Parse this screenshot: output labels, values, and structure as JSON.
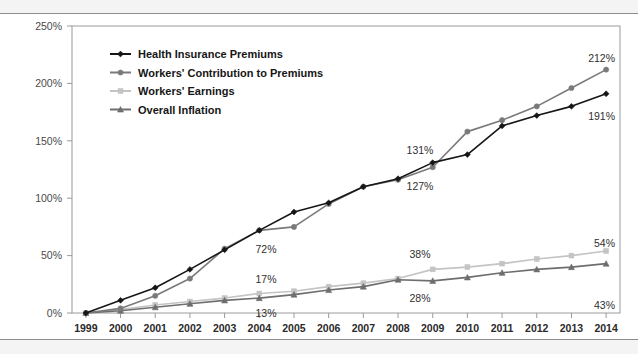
{
  "chart_data": {
    "type": "line",
    "title": "",
    "xlabel": "",
    "ylabel": "",
    "x": [
      1999,
      2000,
      2001,
      2002,
      2003,
      2004,
      2005,
      2006,
      2007,
      2008,
      2009,
      2010,
      2011,
      2012,
      2013,
      2014
    ],
    "categories": [
      "1999",
      "2000",
      "2001",
      "2002",
      "2003",
      "2004",
      "2005",
      "2006",
      "2007",
      "2008",
      "2009",
      "2010",
      "2011",
      "2012",
      "2013",
      "2014"
    ],
    "ylim": [
      0,
      250
    ],
    "ytick_values": [
      0,
      50,
      100,
      150,
      200,
      250
    ],
    "ytick_labels": [
      "0%",
      "50%",
      "100%",
      "150%",
      "200%",
      "250%"
    ],
    "grid": false,
    "legend_position": "top-left-inside",
    "series": [
      {
        "name": "Health Insurance Premiums",
        "color": "#161616",
        "marker": "diamond",
        "values": [
          0,
          11,
          22,
          38,
          55,
          72,
          88,
          96,
          110,
          117,
          131,
          138,
          163,
          172,
          180,
          191
        ]
      },
      {
        "name": "Workers' Contribution to Premiums",
        "color": "#7a7a7a",
        "marker": "circle",
        "values": [
          0,
          4,
          15,
          30,
          56,
          72,
          75,
          95,
          110,
          116,
          127,
          158,
          168,
          180,
          196,
          212
        ]
      },
      {
        "name": "Workers' Earnings",
        "color": "#c4c4c4",
        "marker": "square",
        "values": [
          0,
          3,
          7,
          10,
          13,
          17,
          19,
          23,
          26,
          30,
          38,
          40,
          43,
          47,
          50,
          54
        ]
      },
      {
        "name": "Overall Inflation",
        "color": "#6e6e6e",
        "marker": "triangle",
        "values": [
          0,
          2,
          5,
          8,
          11,
          13,
          16,
          20,
          23,
          29,
          28,
          31,
          35,
          38,
          40,
          43
        ]
      }
    ],
    "annotations": [
      {
        "text": "72%",
        "series": "Workers' Contribution to Premiums",
        "x": 2004,
        "value": 72,
        "px": 266,
        "py": 253
      },
      {
        "text": "17%",
        "series": "Workers' Earnings",
        "x": 2004,
        "value": 17,
        "px": 266,
        "py": 283
      },
      {
        "text": "13%",
        "series": "Overall Inflation",
        "x": 2004,
        "value": 13,
        "px": 266,
        "py": 317
      },
      {
        "text": "131%",
        "series": "Health Insurance Premiums",
        "x": 2009,
        "value": 131,
        "px": 420,
        "py": 154
      },
      {
        "text": "127%",
        "series": "Workers' Contribution to Premiums",
        "x": 2009,
        "value": 127,
        "px": 420,
        "py": 190
      },
      {
        "text": "38%",
        "series": "Workers' Earnings",
        "x": 2009,
        "value": 38,
        "px": 420,
        "py": 258
      },
      {
        "text": "28%",
        "series": "Overall Inflation",
        "x": 2009,
        "value": 28,
        "px": 420,
        "py": 302
      },
      {
        "text": "212%",
        "series": "Workers' Contribution to Premiums",
        "x": 2014,
        "value": 212,
        "px": 615,
        "py": 62
      },
      {
        "text": "191%",
        "series": "Health Insurance Premiums",
        "x": 2014,
        "value": 191,
        "px": 615,
        "py": 120
      },
      {
        "text": "54%",
        "series": "Workers' Earnings",
        "x": 2014,
        "value": 54,
        "px": 615,
        "py": 247
      },
      {
        "text": "43%",
        "series": "Overall Inflation",
        "x": 2014,
        "value": 43,
        "px": 615,
        "py": 309
      }
    ]
  },
  "legend": {
    "items": [
      {
        "label": "Health Insurance Premiums",
        "color": "#161616",
        "marker": "diamond"
      },
      {
        "label": "Workers' Contribution to Premiums",
        "color": "#7a7a7a",
        "marker": "circle"
      },
      {
        "label": "Workers' Earnings",
        "color": "#c4c4c4",
        "marker": "square"
      },
      {
        "label": "Overall Inflation",
        "color": "#6e6e6e",
        "marker": "triangle"
      }
    ]
  },
  "colors": {
    "frame": "#9a9a9a",
    "scan_band": "#f4f4f4",
    "rule": "#8d8d8d",
    "text": "#2f2f2f"
  }
}
